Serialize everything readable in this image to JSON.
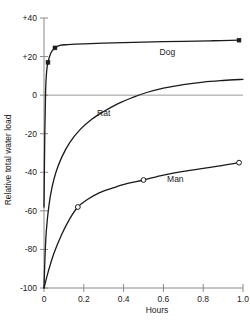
{
  "chart_data": {
    "type": "line",
    "title": "",
    "xlabel": "Hours",
    "ylabel": "Relative total water load",
    "xlim": [
      0,
      1.0
    ],
    "ylim": [
      -100,
      40
    ],
    "grid": false,
    "legend_position": "inline-curve-labels",
    "xticks": [
      "0",
      "0.2",
      "0.4",
      "0.6",
      "0.8",
      "1.0"
    ],
    "xtick_values": [
      0,
      0.2,
      0.4,
      0.6,
      0.8,
      1.0
    ],
    "yticks": [
      "+40",
      "+20",
      "0",
      "-20",
      "-40",
      "-60",
      "-80",
      "-100"
    ],
    "ytick_values": [
      40,
      20,
      0,
      -20,
      -40,
      -60,
      -80,
      -100
    ],
    "zero_reference_line": 0,
    "annotations": [
      {
        "text": "Dog",
        "x": 0.62,
        "y": 21
      },
      {
        "text": "Rat",
        "x": 0.3,
        "y": -11
      },
      {
        "text": "Man",
        "x": 0.66,
        "y": -45
      }
    ],
    "series": [
      {
        "name": "Dog",
        "marker": "filled-square",
        "points": [
          {
            "x": 0.0,
            "y": -58
          },
          {
            "x": 0.004,
            "y": -20
          },
          {
            "x": 0.008,
            "y": 2
          },
          {
            "x": 0.013,
            "y": 12
          },
          {
            "x": 0.02,
            "y": 17
          },
          {
            "x": 0.035,
            "y": 22
          },
          {
            "x": 0.055,
            "y": 24.5
          },
          {
            "x": 0.08,
            "y": 25.8
          },
          {
            "x": 0.12,
            "y": 26.2
          },
          {
            "x": 0.2,
            "y": 26.6
          },
          {
            "x": 0.35,
            "y": 27.1
          },
          {
            "x": 0.5,
            "y": 27.5
          },
          {
            "x": 0.7,
            "y": 27.9
          },
          {
            "x": 0.85,
            "y": 28.2
          },
          {
            "x": 0.98,
            "y": 28.5
          }
        ],
        "markers": [
          {
            "x": 0.02,
            "y": 17
          },
          {
            "x": 0.055,
            "y": 24.5
          },
          {
            "x": 0.98,
            "y": 28.5
          }
        ]
      },
      {
        "name": "Rat",
        "marker": "none",
        "points": [
          {
            "x": 0.0,
            "y": -100
          },
          {
            "x": 0.005,
            "y": -84
          },
          {
            "x": 0.012,
            "y": -70
          },
          {
            "x": 0.025,
            "y": -57
          },
          {
            "x": 0.04,
            "y": -48
          },
          {
            "x": 0.06,
            "y": -40
          },
          {
            "x": 0.09,
            "y": -32
          },
          {
            "x": 0.13,
            "y": -24.5
          },
          {
            "x": 0.18,
            "y": -18
          },
          {
            "x": 0.24,
            "y": -12.5
          },
          {
            "x": 0.3,
            "y": -8.5
          },
          {
            "x": 0.37,
            "y": -4.5
          },
          {
            "x": 0.45,
            "y": -1
          },
          {
            "x": 0.52,
            "y": 1.5
          },
          {
            "x": 0.6,
            "y": 3.6
          },
          {
            "x": 0.7,
            "y": 5.5
          },
          {
            "x": 0.8,
            "y": 6.8
          },
          {
            "x": 0.9,
            "y": 7.6
          },
          {
            "x": 1.0,
            "y": 8.2
          }
        ],
        "markers": []
      },
      {
        "name": "Man",
        "marker": "open-circle",
        "points": [
          {
            "x": 0.0,
            "y": -100
          },
          {
            "x": 0.02,
            "y": -92
          },
          {
            "x": 0.05,
            "y": -82
          },
          {
            "x": 0.09,
            "y": -72
          },
          {
            "x": 0.13,
            "y": -64
          },
          {
            "x": 0.17,
            "y": -58
          },
          {
            "x": 0.22,
            "y": -54
          },
          {
            "x": 0.28,
            "y": -50.5
          },
          {
            "x": 0.35,
            "y": -48
          },
          {
            "x": 0.42,
            "y": -45.8
          },
          {
            "x": 0.5,
            "y": -44
          },
          {
            "x": 0.6,
            "y": -41.5
          },
          {
            "x": 0.7,
            "y": -39.5
          },
          {
            "x": 0.8,
            "y": -38
          },
          {
            "x": 0.9,
            "y": -36.4
          },
          {
            "x": 0.98,
            "y": -35
          }
        ],
        "markers": [
          {
            "x": 0.17,
            "y": -58
          },
          {
            "x": 0.5,
            "y": -44
          },
          {
            "x": 0.98,
            "y": -35
          }
        ]
      }
    ]
  }
}
